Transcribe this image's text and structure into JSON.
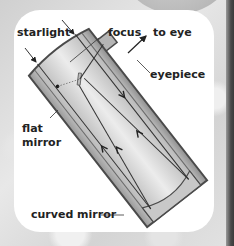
{
  "diagram": {
    "labels": {
      "starlight": "starlight",
      "focus": "focus",
      "to_eye": "to eye",
      "eyepiece": "eyepiece",
      "flat_mirror_line1": "flat",
      "flat_mirror_line2": "mirror",
      "curved_mirror": "curved mirror"
    },
    "colors": {
      "tube_light": "#e6e6e6",
      "tube_dark": "#8a8a8a",
      "outline": "#4a4a4a",
      "ray": "#333333",
      "label": "#222222"
    }
  }
}
